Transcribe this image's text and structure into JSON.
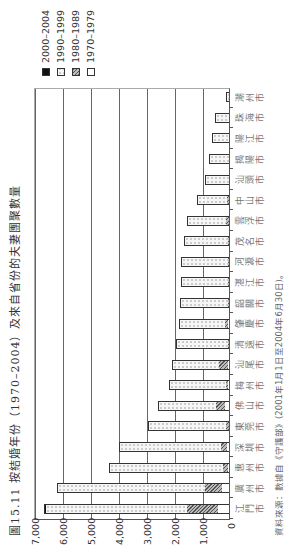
{
  "chart_data": {
    "type": "bar",
    "stacked": true,
    "title": "圖15.11  按結婚年份（1970–2004）及來自省份的夫妻團聚數量",
    "source": "資料來源：數據自《守護部》(2001年1月1日至2004年6月30日)。",
    "xlabel": "",
    "ylabel": "",
    "ylim": [
      0,
      7000
    ],
    "yticks": [
      "0",
      "1,000",
      "2,000",
      "3,000",
      "4,000",
      "5,000",
      "6,000",
      "7,000"
    ],
    "grid": true,
    "legend_position": "right",
    "categories": [
      "江門市",
      "廣州市",
      "惠州市",
      "深圳市",
      "東莞市",
      "佛山市",
      "梅州市",
      "汕尾市",
      "清遠市",
      "肇慶市",
      "韶關市",
      "湛江市",
      "河源市",
      "茂名市",
      "雲浮市",
      "中山市",
      "汕頭市",
      "揭陽市",
      "陽江市",
      "珠海市",
      "潮州市"
    ],
    "series": [
      {
        "name": "1970–1979",
        "values": [
          400,
          250,
          50,
          80,
          0,
          150,
          20,
          50,
          0,
          40,
          0,
          0,
          0,
          0,
          0,
          0,
          0,
          0,
          0,
          0,
          0
        ]
      },
      {
        "name": "1980–1989",
        "values": [
          1100,
          600,
          150,
          220,
          100,
          300,
          100,
          300,
          50,
          110,
          20,
          20,
          20,
          20,
          100,
          80,
          0,
          0,
          0,
          0,
          0
        ]
      },
      {
        "name": "1990–1999",
        "values": [
          5050,
          5250,
          4050,
          3580,
          2800,
          2100,
          2030,
          1700,
          1850,
          1650,
          1700,
          1680,
          1680,
          1600,
          1400,
          1070,
          850,
          700,
          600,
          500,
          100
        ]
      },
      {
        "name": "2000–2004",
        "values": [
          50,
          50,
          30,
          20,
          0,
          0,
          0,
          0,
          0,
          0,
          40,
          0,
          0,
          0,
          0,
          0,
          0,
          0,
          0,
          0,
          0
        ]
      }
    ]
  },
  "legend": [
    {
      "label": "2000–2004",
      "swatch": "s2000"
    },
    {
      "label": "1990–1999",
      "swatch": "s1990"
    },
    {
      "label": "1980–1989",
      "swatch": "s1980"
    },
    {
      "label": "1970–1979",
      "swatch": "s1970"
    }
  ]
}
